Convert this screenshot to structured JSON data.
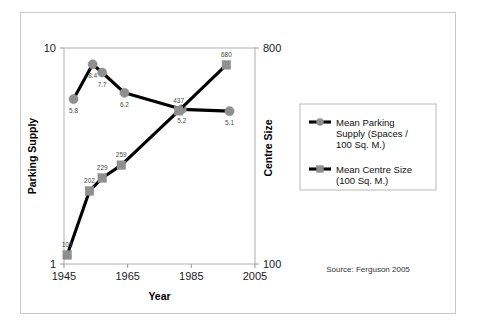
{
  "chart_data": {
    "type": "line",
    "title": "",
    "xlabel": "Year",
    "ylabel": "Parking Supply",
    "y2label": "Centre Size",
    "x": [
      1948,
      1954,
      1957,
      1964,
      1982,
      1997
    ],
    "xlim": [
      1945,
      2005
    ],
    "xticks": [
      1945,
      1965,
      1985,
      2005
    ],
    "xticklabels": [
      "1945",
      "1965",
      "1985",
      "2005"
    ],
    "ylim": [
      1,
      10
    ],
    "yscale": "log",
    "yticks": [
      1,
      10
    ],
    "yticklabels": [
      "1",
      "10"
    ],
    "y2lim": [
      100,
      800
    ],
    "y2scale": "log",
    "y2ticks": [
      100,
      800
    ],
    "y2ticklabels": [
      "100",
      "800"
    ],
    "grid": false,
    "legend_position": "right",
    "series": [
      {
        "name": "Mean Parking Supply (Spaces / 100 Sq. M.)",
        "axis": "left",
        "marker": "circle",
        "x": [
          1948,
          1954,
          1957,
          1964,
          1982,
          1997
        ],
        "values": [
          5.8,
          8.4,
          7.7,
          6.2,
          5.2,
          5.1
        ],
        "labels": [
          "5.8",
          "8.4",
          "7.7",
          "6.2",
          "5.2",
          "5.1"
        ]
      },
      {
        "name": "Mean Centre Size (100 Sq. M.)",
        "axis": "right",
        "marker": "square",
        "x": [
          1946,
          1953,
          1957,
          1963,
          1981,
          1996
        ],
        "values": [
          109,
          202,
          229,
          259,
          437,
          680
        ],
        "labels": [
          "109",
          "202",
          "229",
          "259",
          "437",
          "680"
        ]
      }
    ],
    "annotations": [
      {
        "name": "source",
        "text": "Source: Ferguson 2005"
      }
    ],
    "colors": {
      "marker": "#8f8f8f",
      "line": "#000000",
      "axis": "#9a9a9a",
      "frame": "#c9c9c9",
      "text": "#1a1a1a",
      "label": "#4a4a4a",
      "background": "#ffffff"
    }
  },
  "legend": {
    "entries": [
      {
        "marker": "circle",
        "label": "Mean Parking\nSupply (Spaces /\n100 Sq. M.)",
        "lines": [
          "Mean Parking",
          "Supply (Spaces /",
          "100 Sq. M.)"
        ]
      },
      {
        "marker": "square",
        "label": "Mean Centre Size\n(100 Sq. M.)",
        "lines": [
          "Mean Centre Size",
          "(100 Sq. M.)"
        ]
      }
    ]
  },
  "source": {
    "text": "Source: Ferguson 2005"
  }
}
